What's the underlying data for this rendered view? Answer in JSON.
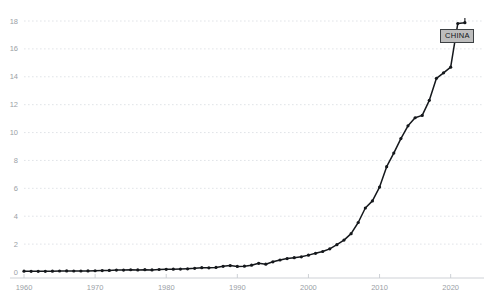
{
  "chart_data": {
    "type": "line",
    "title": "",
    "subtitle": "",
    "xlabel": "",
    "ylabel": "",
    "xlim": [
      1960,
      2023
    ],
    "ylim": [
      0,
      18
    ],
    "grid": true,
    "legend_position": "inline-end-label",
    "series_label": "CHINA",
    "series_color": "#15181c",
    "label_background": "#bdbdbd",
    "label_border": "#3c4043",
    "gridline_color": "#d9dde2",
    "axis_color": "#c8ccd1",
    "tick_label_color": "#9aa0a6",
    "yticks": [
      0,
      2,
      4,
      6,
      8,
      10,
      12,
      14,
      16,
      18
    ],
    "ytick_labels": [
      "0",
      "2",
      "4",
      "6",
      "8",
      "10",
      "12",
      "14",
      "16",
      "18"
    ],
    "xticks": [
      1960,
      1970,
      1980,
      1990,
      2000,
      2010,
      2020
    ],
    "xtick_labels": [
      "1960",
      "1970",
      "1980",
      "1990",
      "2000",
      "2010",
      "2020"
    ],
    "series": [
      {
        "name": "CHINA",
        "x": [
          1960,
          1961,
          1962,
          1963,
          1964,
          1965,
          1966,
          1967,
          1968,
          1969,
          1970,
          1971,
          1972,
          1973,
          1974,
          1975,
          1976,
          1977,
          1978,
          1979,
          1980,
          1981,
          1982,
          1983,
          1984,
          1985,
          1986,
          1987,
          1988,
          1989,
          1990,
          1991,
          1992,
          1993,
          1994,
          1995,
          1996,
          1997,
          1998,
          1999,
          2000,
          2001,
          2002,
          2003,
          2004,
          2005,
          2006,
          2007,
          2008,
          2009,
          2010,
          2011,
          2012,
          2013,
          2014,
          2015,
          2016,
          2017,
          2018,
          2019,
          2020,
          2021,
          2022
        ],
        "values": [
          0.06,
          0.05,
          0.05,
          0.05,
          0.06,
          0.07,
          0.08,
          0.07,
          0.07,
          0.08,
          0.09,
          0.1,
          0.11,
          0.14,
          0.14,
          0.16,
          0.15,
          0.17,
          0.15,
          0.18,
          0.19,
          0.2,
          0.21,
          0.23,
          0.26,
          0.31,
          0.3,
          0.33,
          0.41,
          0.46,
          0.4,
          0.42,
          0.49,
          0.62,
          0.56,
          0.73,
          0.86,
          0.96,
          1.03,
          1.09,
          1.21,
          1.34,
          1.47,
          1.66,
          1.96,
          2.29,
          2.75,
          3.55,
          4.59,
          5.1,
          6.09,
          7.55,
          8.53,
          9.57,
          10.48,
          11.06,
          11.23,
          12.31,
          13.89,
          14.28,
          14.69,
          17.82,
          17.88
        ],
        "marker": "circle",
        "marker_size": 1.6
      }
    ]
  }
}
